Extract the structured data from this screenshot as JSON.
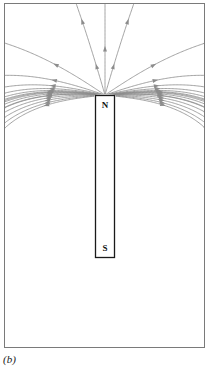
{
  "figure": {
    "caption": "(b)",
    "kind": "magnetic-field-line-diagram",
    "frame": {
      "x": 4,
      "y": 3,
      "width": 201,
      "height": 345,
      "stroke_color": "#7a7a7a",
      "fill_color": "#ffffff",
      "stroke_width": 1
    },
    "magnet": {
      "x": 95,
      "y": 95,
      "width": 20,
      "height": 163,
      "stroke_color": "#1a1a1a",
      "fill_color": "#ffffff",
      "stroke_width": 1.4,
      "north_label": "N",
      "south_label": "S",
      "north_label_x": 105,
      "north_label_y": 105,
      "south_label_x": 105,
      "south_label_y": 249
    },
    "field_lines": {
      "stroke_color": "#8c8c8c",
      "arrow_color": "#8c8c8c",
      "stroke_width": 0.8,
      "description": "Dipole magnetic field lines emerging from the N pole at the top of the bar magnet, looping outward and down, and re-entering at the S pole at the bottom.",
      "arrow_direction_note": "Arrows flow from N to S outside the magnet: upward/outward above N, downward along the sides, inward/upward into S below."
    }
  },
  "chart_data": {
    "type": "line",
    "title": "",
    "xlabel": "",
    "ylabel": "",
    "grid": false,
    "legend": "none",
    "xlim": [
      4,
      205
    ],
    "ylim": [
      3,
      348
    ],
    "dipole": {
      "north_pole": {
        "x": 105,
        "y": 95
      },
      "south_pole": {
        "x": 105,
        "y": 258
      },
      "magnet_half_length": 81.5,
      "magnet_center": {
        "x": 105,
        "y": 176.5
      }
    },
    "series": [
      {
        "name": "loop-1",
        "offset": 3,
        "side": "both",
        "arrow_at": 0.5
      },
      {
        "name": "loop-2",
        "offset": 8,
        "side": "both",
        "arrow_at": 0.5
      },
      {
        "name": "loop-3",
        "offset": 14,
        "side": "both",
        "arrow_at": 0.5
      },
      {
        "name": "loop-4",
        "offset": 21,
        "side": "both",
        "arrow_at": 0.5
      },
      {
        "name": "loop-5",
        "offset": 29,
        "side": "both",
        "arrow_at": 0.5
      },
      {
        "name": "loop-6",
        "offset": 38,
        "side": "both",
        "arrow_at": 0.5
      },
      {
        "name": "loop-7",
        "offset": 48,
        "side": "both",
        "arrow_at": 0.5
      },
      {
        "name": "loop-8",
        "offset": 59,
        "side": "both",
        "arrow_at": 0.5
      },
      {
        "name": "loop-9",
        "offset": 71,
        "side": "both",
        "arrow_at": 0.5
      },
      {
        "name": "loop-10",
        "offset": 84,
        "side": "both",
        "arrow_at": 0.5
      },
      {
        "name": "open-1",
        "offset": 98,
        "side": "both",
        "arrow_at": 0.35
      },
      {
        "name": "open-2",
        "offset": 113,
        "side": "both",
        "arrow_at": 0.32
      },
      {
        "name": "open-3",
        "offset": 129,
        "side": "both",
        "arrow_at": 0.28
      },
      {
        "name": "open-4",
        "offset": 146,
        "side": "both",
        "arrow_at": 0.25
      },
      {
        "name": "open-5",
        "offset": 164,
        "side": "both",
        "arrow_at": 0.22
      },
      {
        "name": "open-6",
        "offset": 183,
        "side": "both",
        "arrow_at": 0.2
      }
    ]
  }
}
